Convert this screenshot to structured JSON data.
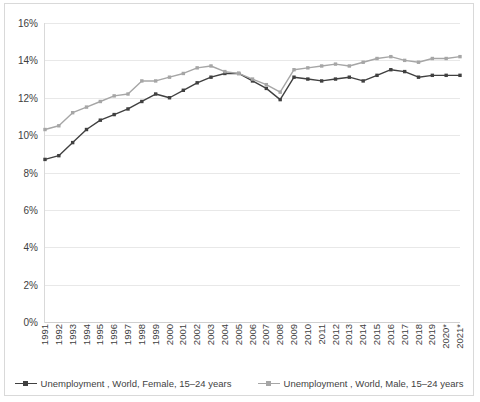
{
  "chart_data": {
    "type": "line",
    "title": "",
    "subtitle": "",
    "xlabel": "",
    "ylabel": "",
    "ylim": [
      0,
      16
    ],
    "y_tick_labels": [
      "0%",
      "2%",
      "4%",
      "6%",
      "8%",
      "10%",
      "12%",
      "14%",
      "16%"
    ],
    "y_tick_values": [
      0,
      2,
      4,
      6,
      8,
      10,
      12,
      14,
      16
    ],
    "grid": true,
    "legend_position": "bottom",
    "categories": [
      "1991",
      "1992",
      "1993",
      "1994",
      "1995",
      "1996",
      "1997",
      "1998",
      "1999",
      "2000",
      "2001",
      "2002",
      "2003",
      "2004",
      "2005",
      "2006",
      "2007",
      "2008",
      "2009",
      "2010",
      "2011",
      "2012",
      "2013",
      "2014",
      "2015",
      "2016",
      "2017",
      "2018",
      "2019",
      "2020*",
      "2021*"
    ],
    "series": [
      {
        "name": "Unemployment , World, Female, 15–24 years",
        "color": "#404040",
        "values": [
          8.7,
          8.9,
          9.6,
          10.3,
          10.8,
          11.1,
          11.4,
          11.8,
          12.2,
          12.0,
          12.4,
          12.8,
          13.1,
          13.3,
          13.3,
          12.9,
          12.5,
          11.9,
          13.1,
          13.0,
          12.9,
          13.0,
          13.1,
          12.9,
          13.2,
          13.5,
          13.4,
          13.1,
          13.2,
          13.2,
          13.2
        ]
      },
      {
        "name": "Unemployment , World, Male, 15–24 years",
        "color": "#a6a6a6",
        "values": [
          10.3,
          10.5,
          11.2,
          11.5,
          11.8,
          12.1,
          12.2,
          12.9,
          12.9,
          13.1,
          13.3,
          13.6,
          13.7,
          13.4,
          13.3,
          13.0,
          12.7,
          12.3,
          13.5,
          13.6,
          13.7,
          13.8,
          13.7,
          13.9,
          14.1,
          14.2,
          14.0,
          13.9,
          14.1,
          14.1,
          14.2
        ]
      }
    ]
  }
}
